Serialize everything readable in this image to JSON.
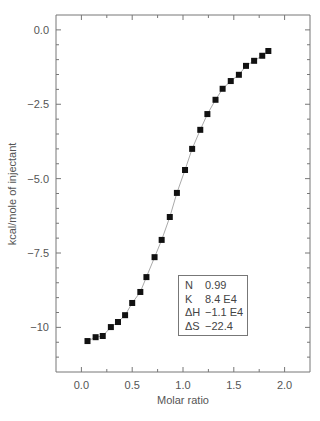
{
  "chart_data": {
    "type": "scatter",
    "title": "",
    "xlabel": "Molar ratio",
    "ylabel": "kcal/mole of injectant",
    "xlim": [
      -0.25,
      2.25
    ],
    "ylim": [
      -11.5,
      0.5
    ],
    "xticks": [
      0.0,
      0.5,
      1.0,
      1.5,
      2.0
    ],
    "xtick_labels": [
      "0.0",
      "0.5",
      "1.0",
      "1.5",
      "2.0"
    ],
    "yticks": [
      0.0,
      -2.5,
      -5.0,
      -7.5,
      -10
    ],
    "ytick_labels": [
      "0.0",
      "−2.5",
      "−5.0",
      "−7.5",
      "−10"
    ],
    "grid": false,
    "series": [
      {
        "name": "Injections",
        "marker": "square",
        "color": "#111111",
        "x": [
          0.06,
          0.14,
          0.21,
          0.29,
          0.36,
          0.43,
          0.5,
          0.58,
          0.64,
          0.72,
          0.79,
          0.87,
          0.94,
          1.02,
          1.09,
          1.17,
          1.24,
          1.32,
          1.39,
          1.47,
          1.55,
          1.62,
          1.7,
          1.78,
          1.84
        ],
        "y": [
          -10.46,
          -10.33,
          -10.29,
          -9.99,
          -9.82,
          -9.59,
          -9.18,
          -8.81,
          -8.31,
          -7.64,
          -7.06,
          -6.29,
          -5.48,
          -4.71,
          -4.0,
          -3.36,
          -2.83,
          -2.35,
          -1.98,
          -1.72,
          -1.51,
          -1.21,
          -1.04,
          -0.87,
          -0.71
        ]
      },
      {
        "name": "Fit",
        "type": "line",
        "color": "#aaaaaa"
      }
    ],
    "annotation": {
      "rows": [
        {
          "key": "N",
          "value": "0.99"
        },
        {
          "key": "K",
          "value": "8.4 E4"
        },
        {
          "key": "ΔH",
          "value": "−1.1 E4"
        },
        {
          "key": "ΔS",
          "value": "−22.4"
        }
      ],
      "placement": "bottom-right"
    }
  }
}
